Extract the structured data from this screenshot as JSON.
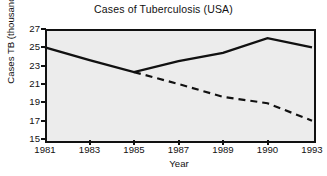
{
  "chart_data": {
    "type": "line",
    "title": "Cases of Tuberculosis (USA)",
    "xlabel": "Year",
    "ylabel": "Cases TB (thousand)",
    "xlim": [
      1981,
      1993
    ],
    "ylim": [
      15,
      27
    ],
    "grid": false,
    "legend": "none",
    "x_tick_labels": [
      "1981",
      "1983",
      "1985",
      "1987",
      "1989",
      "1990",
      "1993"
    ],
    "x_tick_values": [
      1981,
      1983,
      1985,
      1987,
      1989,
      1990,
      1993
    ],
    "y_tick_labels": [
      "15",
      "17",
      "19",
      "21",
      "23",
      "25",
      "27"
    ],
    "y_tick_values": [
      15,
      17,
      19,
      21,
      23,
      25,
      27
    ],
    "series": [
      {
        "name": "Actual cases",
        "style": "solid",
        "color": "#111111",
        "x": [
          1981,
          1983,
          1985,
          1987,
          1989,
          1990,
          1993
        ],
        "values": [
          25.0,
          23.6,
          22.3,
          23.5,
          24.4,
          26.0,
          25.0
        ]
      },
      {
        "name": "Expected trend",
        "style": "dashed",
        "color": "#111111",
        "x": [
          1985,
          1987,
          1989,
          1990,
          1993
        ],
        "values": [
          22.3,
          21.0,
          19.6,
          18.9,
          17.0
        ]
      }
    ]
  }
}
